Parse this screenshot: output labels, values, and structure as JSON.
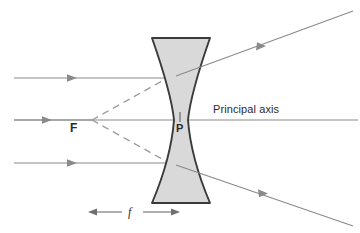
{
  "figure": {
    "kind": "optics-ray-diagram",
    "background_color": "#ffffff"
  },
  "colors": {
    "ray_line": "#8a8a8a",
    "virtual_ray_dashed": "#9a9a9a",
    "axis_line": "#8a8a8a",
    "lens_fill": "#d9d9d9",
    "lens_outline": "#3a3a3a",
    "label_text": "#2b2b2b"
  },
  "labels": {
    "principal_axis": "Principal axis",
    "focal_point": "F",
    "pole": "P",
    "focal_length": "f"
  },
  "lens": {
    "name": "concave-diverging-lens",
    "top_edge_y": 38,
    "bottom_edge_y": 203,
    "top_left_x": 152,
    "top_right_x": 210,
    "waist_left_x": 172,
    "waist_right_x": 188,
    "waist_y": 120,
    "fill": "#d9d9d9",
    "outline": "#3a3a3a"
  },
  "axis": {
    "y": 120,
    "x_start": 14,
    "x_end": 358
  },
  "focal_point": {
    "x": 92,
    "y": 120
  },
  "pole_point": {
    "x": 180,
    "y": 120
  },
  "focal_length_indicator": {
    "y": 212,
    "x_start": 88,
    "x_end": 180,
    "label": "f"
  },
  "incident_rays": [
    {
      "name": "upper-incident-ray",
      "y": 78,
      "x_start": 14,
      "x_end": 176,
      "arrow_x": 75
    },
    {
      "name": "axial-incident-ray",
      "y": 120,
      "x_start": 14,
      "x_end": 92,
      "arrow_x": 50
    },
    {
      "name": "lower-incident-ray",
      "y": 163,
      "x_start": 14,
      "x_end": 176,
      "arrow_x": 75
    }
  ],
  "refracted_rays": [
    {
      "name": "upper-refracted-ray",
      "x1": 182,
      "y1": 73,
      "x2": 352,
      "y2": 12,
      "arrow_t": 0.52
    },
    {
      "name": "lower-refracted-ray",
      "x1": 182,
      "y1": 166,
      "x2": 352,
      "y2": 224,
      "arrow_t": 0.5
    }
  ],
  "virtual_rays": [
    {
      "name": "upper-virtual-ray-dashed",
      "x1": 92,
      "y1": 120,
      "x2": 196,
      "y2": 62
    },
    {
      "name": "lower-virtual-ray-dashed",
      "x1": 92,
      "y1": 120,
      "x2": 196,
      "y2": 178
    }
  ]
}
